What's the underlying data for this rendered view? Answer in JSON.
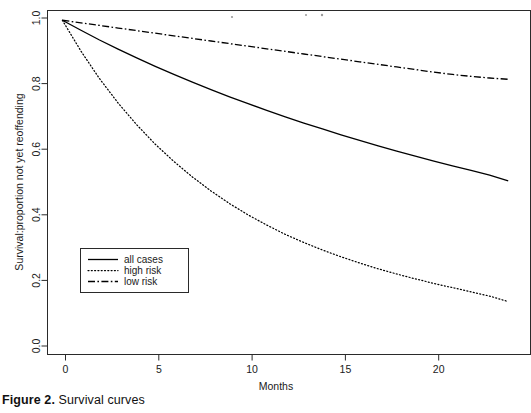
{
  "figure": {
    "caption_label": "Figure 2.",
    "caption_text": "Survival curves"
  },
  "chart_data": {
    "type": "line",
    "title": "",
    "xlabel": "Months",
    "ylabel": "Survival:proportion not yet reoffending",
    "xlim": [
      -0.8,
      25.2
    ],
    "ylim": [
      -0.03,
      1.03
    ],
    "xticks": [
      0,
      5,
      10,
      15,
      20
    ],
    "xtick_labels": [
      "0",
      "5",
      "10",
      "15",
      "20"
    ],
    "yticks": [
      0.0,
      0.2,
      0.4,
      0.6,
      0.8,
      1.0
    ],
    "ytick_labels": [
      "0.0",
      "0.2",
      "0.4",
      "0.6",
      "0.8",
      "1.0"
    ],
    "grid": false,
    "legend_position": "center-left",
    "x": [
      0,
      1,
      2,
      3,
      4,
      5,
      6,
      7,
      8,
      9,
      10,
      11,
      12,
      13,
      14,
      15,
      16,
      17,
      18,
      19,
      20,
      21,
      22,
      23,
      24
    ],
    "series": [
      {
        "name": "all cases",
        "linestyle": "solid",
        "color": "#000000",
        "values": [
          1.0,
          0.969,
          0.939,
          0.911,
          0.884,
          0.858,
          0.833,
          0.809,
          0.786,
          0.764,
          0.743,
          0.722,
          0.702,
          0.683,
          0.665,
          0.647,
          0.63,
          0.613,
          0.597,
          0.581,
          0.566,
          0.551,
          0.537,
          0.523,
          0.505
        ]
      },
      {
        "name": "high risk",
        "linestyle": "dotted",
        "color": "#000000",
        "values": [
          1.0,
          0.905,
          0.82,
          0.745,
          0.678,
          0.618,
          0.565,
          0.517,
          0.474,
          0.435,
          0.4,
          0.369,
          0.34,
          0.315,
          0.292,
          0.271,
          0.252,
          0.234,
          0.218,
          0.203,
          0.189,
          0.176,
          0.163,
          0.15,
          0.133
        ]
      },
      {
        "name": "low risk",
        "linestyle": "dashdot",
        "color": "#000000",
        "values": [
          1.0,
          0.992,
          0.984,
          0.976,
          0.968,
          0.96,
          0.952,
          0.944,
          0.936,
          0.928,
          0.92,
          0.912,
          0.904,
          0.896,
          0.888,
          0.88,
          0.872,
          0.864,
          0.856,
          0.848,
          0.84,
          0.833,
          0.827,
          0.822,
          0.818
        ]
      }
    ],
    "legend_entries": [
      {
        "label": "all cases",
        "linestyle": "solid"
      },
      {
        "label": "high risk",
        "linestyle": "dotted"
      },
      {
        "label": "low risk",
        "linestyle": "dashdot"
      }
    ]
  }
}
